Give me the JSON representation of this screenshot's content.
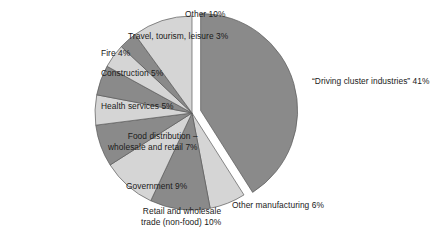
{
  "chart_data": {
    "type": "pie",
    "title": "",
    "subtitle": "",
    "xlabel": "",
    "ylabel": "",
    "legend_position": "outside-labels",
    "grid": false,
    "units": "percent",
    "total": 100,
    "exploded_slice": "“Driving cluster industries”",
    "colors": {
      "dark": "#8a8a8a",
      "light": "#d5d5d5",
      "outline": "#5a5a5a",
      "background": "#ffffff",
      "text": "#1a1a1a"
    },
    "categories": [
      "“Driving cluster industries”",
      "Other manufacturing",
      "Retail and wholesale trade (non-food)",
      "Government",
      "Food distribution – wholesale and retail",
      "Health services",
      "Construction",
      "Fire",
      "Travel, tourism, leisure",
      "Other"
    ],
    "values": [
      41,
      6,
      10,
      9,
      7,
      5,
      5,
      4,
      3,
      10
    ],
    "slices": [
      {
        "id": "driving-cluster-industries",
        "label": "“Driving cluster industries” 41%",
        "label_line1": "“Driving cluster industries” 41%",
        "label_line2": "",
        "name": "“Driving cluster industries”",
        "value": 41,
        "percent_text": "41%",
        "shade": "dark",
        "exploded": true
      },
      {
        "id": "other-manufacturing",
        "label": "Other manufacturing 6%",
        "label_line1": "Other manufacturing 6%",
        "label_line2": "",
        "name": "Other manufacturing",
        "value": 6,
        "percent_text": "6%",
        "shade": "light",
        "exploded": false
      },
      {
        "id": "retail-wholesale-trade",
        "label": "Retail and wholesale trade (non-food) 10%",
        "label_line1": "Retail and wholesale",
        "label_line2": "trade (non-food) 10%",
        "name": "Retail and wholesale trade (non-food)",
        "value": 10,
        "percent_text": "10%",
        "shade": "dark",
        "exploded": false
      },
      {
        "id": "government",
        "label": "Government 9%",
        "label_line1": "Government 9%",
        "label_line2": "",
        "name": "Government",
        "value": 9,
        "percent_text": "9%",
        "shade": "light",
        "exploded": false
      },
      {
        "id": "food-distribution",
        "label": "Food distribution – wholesale and retail 7%",
        "label_line1": "Food distribution –",
        "label_line2": "wholesale and retail 7%",
        "name": "Food distribution – wholesale and retail",
        "value": 7,
        "percent_text": "7%",
        "shade": "dark",
        "exploded": false
      },
      {
        "id": "health-services",
        "label": "Health services 5%",
        "label_line1": "Health services 5%",
        "label_line2": "",
        "name": "Health services",
        "value": 5,
        "percent_text": "5%",
        "shade": "light",
        "exploded": false
      },
      {
        "id": "construction",
        "label": "Construction 5%",
        "label_line1": "Construction 5%",
        "label_line2": "",
        "name": "Construction",
        "value": 5,
        "percent_text": "5%",
        "shade": "dark",
        "exploded": false
      },
      {
        "id": "fire",
        "label": "Fire 4%",
        "label_line1": "Fire 4%",
        "label_line2": "",
        "name": "Fire",
        "value": 4,
        "percent_text": "4%",
        "shade": "light",
        "exploded": false
      },
      {
        "id": "travel-tourism-leisure",
        "label": "Travel, tourism, leisure 3%",
        "label_line1": "Travel, tourism, leisure 3%",
        "label_line2": "",
        "name": "Travel, tourism, leisure",
        "value": 3,
        "percent_text": "3%",
        "shade": "dark",
        "exploded": false
      },
      {
        "id": "other",
        "label": "Other 10%",
        "label_line1": "Other 10%",
        "label_line2": "",
        "name": "Other",
        "value": 10,
        "percent_text": "10%",
        "shade": "light",
        "exploded": false
      }
    ]
  },
  "geometry": {
    "center_x": 192,
    "center_y": 113,
    "radius": 97,
    "start_angle_deg": -90,
    "explode_offset": 9,
    "label_positions": [
      {
        "id": "driving-cluster-industries",
        "x": 312,
        "y": 76,
        "align": "lbl-right"
      },
      {
        "id": "other-manufacturing",
        "x": 232,
        "y": 200,
        "align": "lbl-right"
      },
      {
        "id": "retail-wholesale-trade",
        "x": 141,
        "y": 206,
        "align": "lbl-left"
      },
      {
        "id": "government",
        "x": 126,
        "y": 181,
        "align": "lbl-left"
      },
      {
        "id": "food-distribution",
        "x": 108,
        "y": 131,
        "align": "lbl-left"
      },
      {
        "id": "health-services",
        "x": 101,
        "y": 101,
        "align": "lbl-left"
      },
      {
        "id": "construction",
        "x": 101,
        "y": 68,
        "align": "lbl-left"
      },
      {
        "id": "fire",
        "x": 101,
        "y": 48,
        "align": "lbl-left"
      },
      {
        "id": "travel-tourism-leisure",
        "x": 128,
        "y": 31,
        "align": "lbl-left"
      },
      {
        "id": "other",
        "x": 185,
        "y": 9,
        "align": "lbl-left"
      }
    ]
  }
}
